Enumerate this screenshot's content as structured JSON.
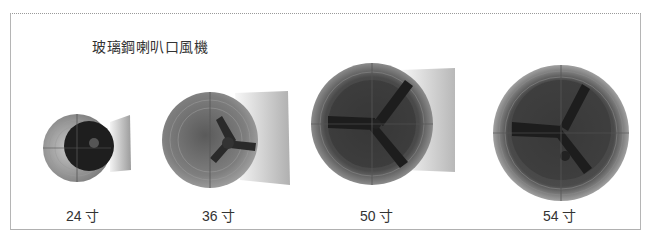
{
  "title": "玻璃鋼喇叭口風機",
  "fans": [
    {
      "label": "24 寸",
      "size_inch": 24
    },
    {
      "label": "36 寸",
      "size_inch": 36
    },
    {
      "label": "50 寸",
      "size_inch": 50
    },
    {
      "label": "54 寸",
      "size_inch": 54
    }
  ],
  "colors": {
    "frame_border": "#b5b5b5",
    "text": "#333333",
    "fan_dark": "#2b2b2b",
    "fan_mid": "#8a8a8a",
    "housing": "#d9d9d9"
  }
}
